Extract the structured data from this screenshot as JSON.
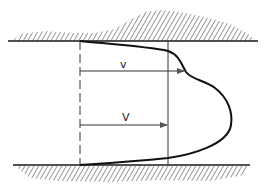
{
  "diagram": {
    "title": "",
    "labels": {
      "local_velocity": "v",
      "mean_velocity": "V"
    },
    "colors": {
      "ink": "#1a1a1a",
      "background": "#ffffff"
    },
    "elements": [
      {
        "name": "top-wall",
        "type": "hatched boundary"
      },
      {
        "name": "bottom-wall",
        "type": "hatched boundary"
      },
      {
        "name": "reference-line",
        "type": "dashed vertical"
      },
      {
        "name": "mean-velocity-line",
        "type": "solid vertical"
      },
      {
        "name": "velocity-profile",
        "type": "curve"
      },
      {
        "name": "arrow-v",
        "label": "v"
      },
      {
        "name": "arrow-V",
        "label": "V"
      }
    ]
  }
}
